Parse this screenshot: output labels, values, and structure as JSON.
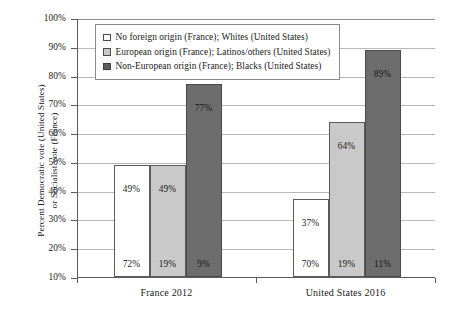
{
  "chart_data": {
    "type": "bar",
    "title": "",
    "xlabel": "",
    "ylabel": "Percent Democratic vote (United States)\nor Socialist vote (France)",
    "categories": [
      "France 2012",
      "United States 2016"
    ],
    "ylim": [
      10,
      100
    ],
    "yticks": [
      "10%",
      "20%",
      "30%",
      "40%",
      "50%",
      "60%",
      "70%",
      "80%",
      "90%",
      "100%"
    ],
    "ytick_values": [
      10,
      20,
      30,
      40,
      50,
      60,
      70,
      80,
      90,
      100
    ],
    "grid": true,
    "legend_position": "top-left-inside",
    "series": [
      {
        "name": "No foreign origin (France); Whites (United States)",
        "values": [
          49,
          37
        ],
        "value_labels": [
          "49%",
          "37%"
        ],
        "share_labels": [
          "72%",
          "70%"
        ],
        "color": "#ffffff"
      },
      {
        "name": "European origin (France); Latinos/others (United States)",
        "values": [
          49,
          64
        ],
        "value_labels": [
          "49%",
          "64%"
        ],
        "share_labels": [
          "19%",
          "19%"
        ],
        "color": "#c9c9c9"
      },
      {
        "name": "Non-European origin (France); Blacks (United States)",
        "values": [
          77,
          89
        ],
        "value_labels": [
          "77%",
          "89%"
        ],
        "share_labels": [
          "9%",
          "11%"
        ],
        "color": "#6d6d6d"
      }
    ]
  }
}
